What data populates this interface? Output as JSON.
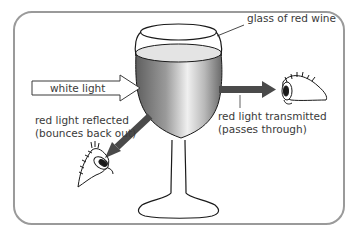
{
  "diagram": {
    "labels": {
      "glass": "glass of red wine",
      "white_light": "white light",
      "reflected_line1": "red light reflected",
      "reflected_line2": "(bounces back out)",
      "transmitted_line1": "red light transmitted",
      "transmitted_line2": "(passes through)"
    },
    "colors": {
      "frame": "#9a9a9a",
      "outline": "#1a1a1a",
      "arrow_dark": "#4a4a4a",
      "wine_dark": "#6e6e6e",
      "wine_light": "#e6e6e6",
      "text": "#3a3a3a"
    },
    "icons": [
      "eye-icon-right",
      "eye-icon-left"
    ]
  }
}
